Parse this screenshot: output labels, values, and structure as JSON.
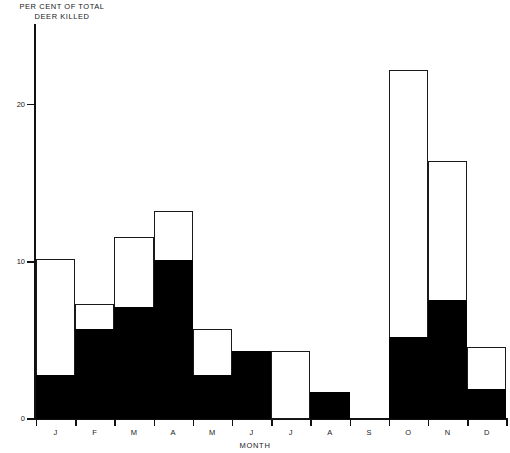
{
  "chart_data": {
    "type": "bar",
    "title": "",
    "subtitle": "",
    "ylabel": "PER CENT OF TOTAL\nDEER KILLED",
    "xlabel": "MONTH",
    "categories": [
      "J",
      "F",
      "M",
      "A",
      "M",
      "J",
      "J",
      "A",
      "S",
      "O",
      "N",
      "D"
    ],
    "ytick_labels": [
      "0",
      "10",
      "20"
    ],
    "ytick_values": [
      0,
      10,
      20
    ],
    "ylim": [
      0,
      25
    ],
    "grid": false,
    "legend": null,
    "annotations": [],
    "series": [
      {
        "name": "Total deer killed (outline)",
        "style": "outline",
        "color": "#ffffff",
        "edge_color": "#1a1a1a",
        "values": [
          10.2,
          7.3,
          11.6,
          13.2,
          5.7,
          4.3,
          4.3,
          1.7,
          0,
          22.2,
          16.4,
          4.6
        ]
      },
      {
        "name": "Sub-group deer killed (solid)",
        "style": "filled",
        "color": "#000000",
        "values": [
          2.8,
          5.7,
          7.1,
          10.1,
          2.8,
          4.3,
          0,
          1.7,
          0,
          5.2,
          7.6,
          1.9
        ]
      }
    ]
  },
  "axis": {
    "y_title": "PER CENT OF TOTAL\nDEER KILLED",
    "x_title": "MONTH"
  }
}
